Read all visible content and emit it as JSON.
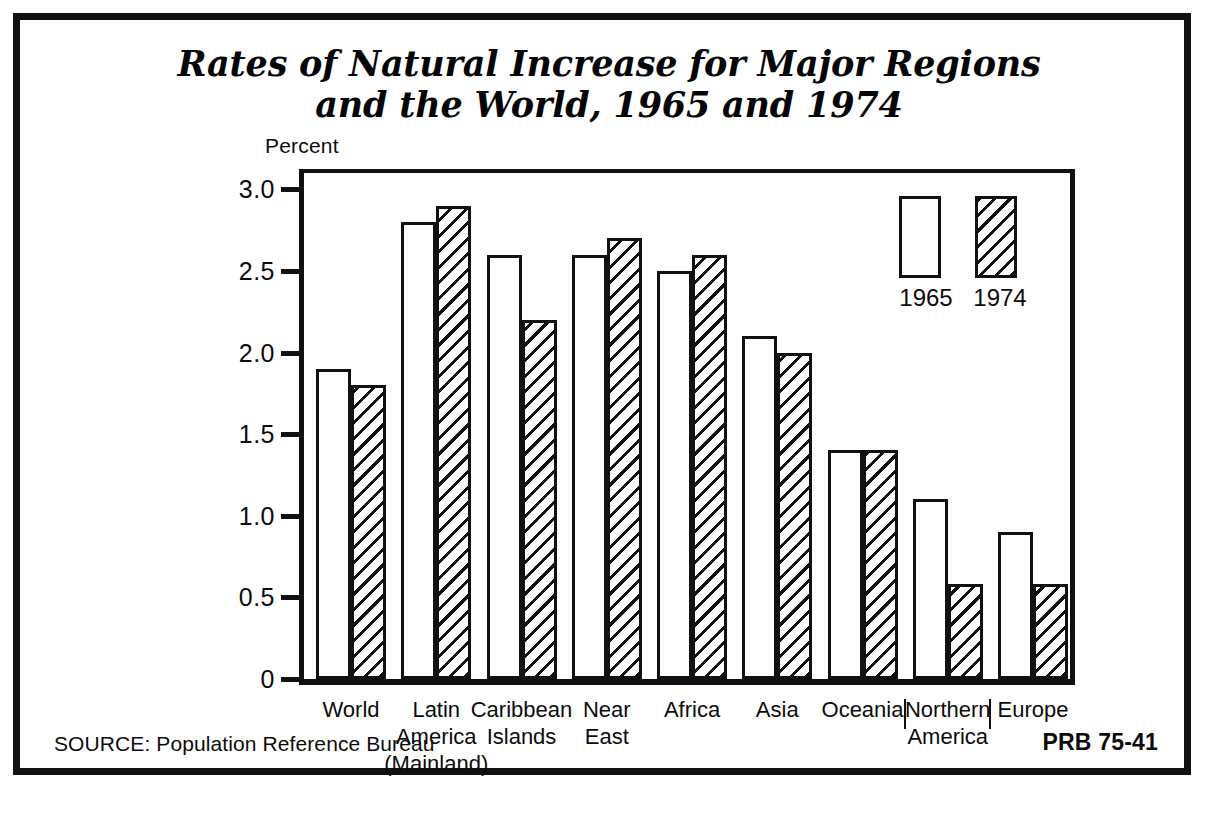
{
  "figure": {
    "title_line_1": "Rates of Natural Increase for Major Regions",
    "title_line_2": "and the World, 1965 and 1974",
    "axis_unit_label": "Percent",
    "source_note": "SOURCE: Population Reference Bureau",
    "publication_code": "PRB 75-41",
    "ink_color": "#111111",
    "background_color": "#ffffff"
  },
  "legend": {
    "position": "top-right-inside-plot",
    "entries": [
      {
        "label": "1965",
        "style": "open"
      },
      {
        "label": "1974",
        "style": "hatched"
      }
    ]
  },
  "chart_data": {
    "type": "bar",
    "title": "Rates of Natural Increase for Major Regions and the World, 1965 and 1974",
    "xlabel": "",
    "ylabel": "Percent",
    "ylim": [
      0,
      3.1
    ],
    "yticks": [
      0,
      0.5,
      1.0,
      1.5,
      2.0,
      2.5,
      3.0
    ],
    "ytick_labels": [
      "0",
      "0.5",
      "1.0",
      "1.5",
      "2.0",
      "2.5",
      "3.0"
    ],
    "grid": false,
    "legend_position": "upper right",
    "categories": [
      "World",
      "Latin America (Mainland)",
      "Caribbean Islands",
      "Near East",
      "Africa",
      "Asia",
      "Oceania",
      "Northern America",
      "Europe"
    ],
    "category_label_lines": [
      [
        "World"
      ],
      [
        "Latin",
        "America",
        "(Mainland)"
      ],
      [
        "Caribbean",
        "Islands"
      ],
      [
        "Near",
        "East"
      ],
      [
        "Africa"
      ],
      [
        "Asia"
      ],
      [
        "Oceania"
      ],
      [
        "Northern",
        "America"
      ],
      [
        "Europe"
      ]
    ],
    "series": [
      {
        "name": "1965",
        "style": "open",
        "values": [
          1.9,
          2.8,
          2.6,
          2.6,
          2.5,
          2.1,
          1.4,
          1.1,
          0.9
        ]
      },
      {
        "name": "1974",
        "style": "hatched",
        "values": [
          1.8,
          2.9,
          2.2,
          2.7,
          2.6,
          2.0,
          1.4,
          0.58,
          0.58
        ]
      }
    ]
  }
}
